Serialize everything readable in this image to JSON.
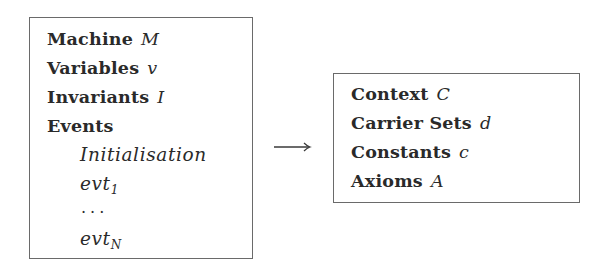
{
  "machine": {
    "title_keyword": "Machine",
    "title_var": "M",
    "variables_keyword": "Variables",
    "variables_var": "v",
    "invariants_keyword": "Invariants",
    "invariants_var": "I",
    "events_keyword": "Events",
    "events": {
      "initialisation": "Initialisation",
      "first": {
        "base": "evt",
        "sub": "1"
      },
      "ellipsis": "...",
      "last": {
        "base": "evt",
        "sub": "N"
      }
    }
  },
  "arrow": {
    "glyph": "→",
    "meaning": "sees"
  },
  "context": {
    "title_keyword": "Context",
    "title_var": "C",
    "carrier_sets_keyword": "Carrier Sets",
    "carrier_sets_var": "d",
    "constants_keyword": "Constants",
    "constants_var": "c",
    "axioms_keyword": "Axioms",
    "axioms_var": "A"
  },
  "colors": {
    "border": "#6a6a6a",
    "text": "#2a2a2a",
    "background": "#ffffff"
  }
}
